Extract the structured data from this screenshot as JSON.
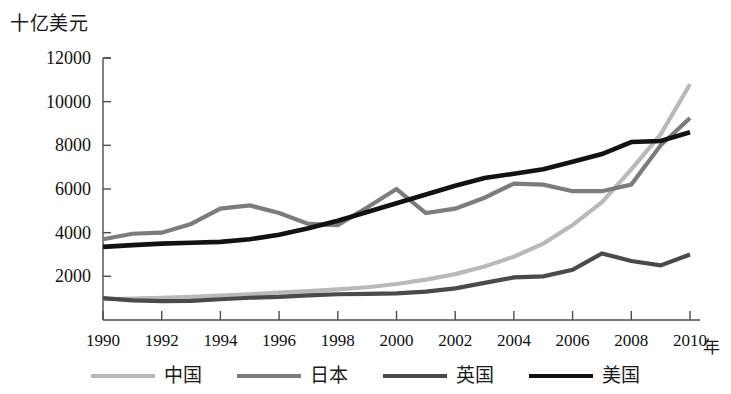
{
  "chart_data": {
    "type": "line",
    "title": "",
    "ylabel": "十亿美元",
    "xlabel": "年",
    "x": [
      1990,
      1991,
      1992,
      1993,
      1994,
      1995,
      1996,
      1997,
      1998,
      1999,
      2000,
      2001,
      2002,
      2003,
      2004,
      2005,
      2006,
      2007,
      2008,
      2009,
      2010
    ],
    "xticks": [
      "1990",
      "1992",
      "1994",
      "1996",
      "1998",
      "2000",
      "2002",
      "2004",
      "2006",
      "2008",
      "2010"
    ],
    "yticks": [
      "2000",
      "4000",
      "6000",
      "8000",
      "10000",
      "12000"
    ],
    "ylim": [
      0,
      12000
    ],
    "xlim": [
      1990,
      2010
    ],
    "grid": false,
    "legend_position": "bottom",
    "series": [
      {
        "name": "中国",
        "color": "#b9b9b9",
        "width": 4.2,
        "values": [
          950,
          980,
          1020,
          1060,
          1120,
          1180,
          1250,
          1320,
          1400,
          1500,
          1650,
          1850,
          2100,
          2450,
          2900,
          3500,
          4350,
          5400,
          6900,
          8500,
          10800
        ]
      },
      {
        "name": "日本",
        "color": "#7c7c7c",
        "width": 4.2,
        "values": [
          3700,
          3950,
          4000,
          4400,
          5100,
          5250,
          4900,
          4400,
          4350,
          5150,
          6000,
          4900,
          5100,
          5600,
          6250,
          6200,
          5900,
          5900,
          6200,
          8000,
          9250
        ]
      },
      {
        "name": "英国",
        "color": "#4a4a4a",
        "width": 4.2,
        "values": [
          1000,
          900,
          860,
          880,
          950,
          1020,
          1060,
          1130,
          1180,
          1200,
          1220,
          1300,
          1450,
          1700,
          1950,
          2000,
          2300,
          3050,
          2700,
          2500,
          3000
        ]
      },
      {
        "name": "美国",
        "color": "#121212",
        "width": 4.6,
        "values": [
          3350,
          3430,
          3500,
          3540,
          3580,
          3700,
          3900,
          4200,
          4550,
          4950,
          5350,
          5750,
          6150,
          6500,
          6700,
          6900,
          7250,
          7600,
          8150,
          8200,
          8600
        ]
      }
    ]
  },
  "axes": {
    "y_axis_name": "十亿美元",
    "x_axis_name": "年"
  },
  "legend": {
    "items": [
      {
        "label": "中国",
        "color": "#b9b9b9"
      },
      {
        "label": "日本",
        "color": "#7c7c7c"
      },
      {
        "label": "英国",
        "color": "#4a4a4a"
      },
      {
        "label": "美国",
        "color": "#121212"
      }
    ]
  }
}
